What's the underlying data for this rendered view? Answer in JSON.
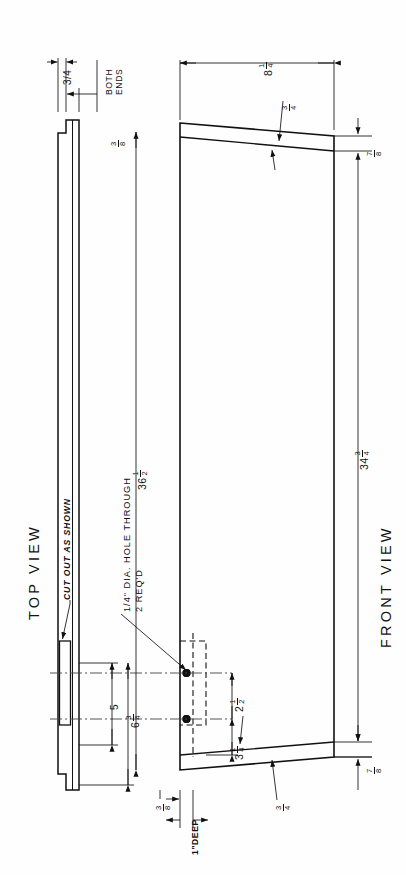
{
  "drawing": {
    "title": "Tapered board — two-view machine drawing",
    "views": [
      {
        "id": "top-view",
        "label": "TOP VIEW"
      },
      {
        "id": "front-view",
        "label": "FRONT VIEW"
      }
    ],
    "notes": [
      {
        "id": "both-ends",
        "line1": "BOTH",
        "line2": "ENDS"
      },
      {
        "id": "cut-out",
        "text": "CUT OUT AS SHOWN"
      },
      {
        "id": "hole-callout-line1",
        "text": "1/4\" DIA. HOLE THROUGH"
      },
      {
        "id": "hole-callout-line2",
        "text": "2 REQ'D"
      },
      {
        "id": "depth-note",
        "text": "1\"DEEP"
      }
    ],
    "dimensions": [
      {
        "id": "notch-width",
        "whole": "",
        "num": "3",
        "den": "4",
        "plain": "3/4",
        "view": "top",
        "desc": "notch width at both ends"
      },
      {
        "id": "notch-depth",
        "whole": "",
        "num": "3",
        "den": "8",
        "plain": "",
        "view": "top",
        "desc": "notch depth"
      },
      {
        "id": "top-left-offset",
        "whole": "8",
        "num": "1",
        "den": "4",
        "plain": "",
        "view": "front",
        "desc": "distance from left end to start of taper"
      },
      {
        "id": "thickness-top",
        "whole": "",
        "num": "3",
        "den": "4",
        "plain": "",
        "view": "front",
        "desc": "board edge thickness at top taper"
      },
      {
        "id": "right-end-height",
        "whole": "",
        "num": "7",
        "den": "8",
        "plain": "",
        "view": "front",
        "desc": "right end thickness, top"
      },
      {
        "id": "overall-length",
        "whole": "36",
        "num": "1",
        "den": "2",
        "plain": "",
        "view": "front",
        "desc": "overall length"
      },
      {
        "id": "board-width",
        "whole": "34",
        "num": "3",
        "den": "4",
        "plain": "",
        "view": "front",
        "desc": "overall width, right side"
      },
      {
        "id": "hole-edge-dist",
        "whole": "5",
        "num": "",
        "den": "",
        "plain": "5",
        "view": "top",
        "desc": "5 in. dimension"
      },
      {
        "id": "hole-spacing-long",
        "whole": "6",
        "num": "3",
        "den": "4",
        "plain": "",
        "view": "top",
        "desc": "6 3/4 in. dimension"
      },
      {
        "id": "hole-spacing",
        "whole": "2",
        "num": "1",
        "den": "2",
        "plain": "",
        "view": "front",
        "desc": "spacing between the two holes"
      },
      {
        "id": "hole-to-edge",
        "whole": "3",
        "num": "1",
        "den": "4",
        "plain": "",
        "view": "front",
        "desc": "lower hole to bottom edge"
      },
      {
        "id": "cutout-width",
        "whole": "",
        "num": "3",
        "den": "8",
        "plain": "",
        "view": "front",
        "desc": "cut-out width"
      },
      {
        "id": "thickness-bottom",
        "whole": "",
        "num": "3",
        "den": "4",
        "plain": "",
        "view": "front",
        "desc": "board edge thickness at bottom taper"
      },
      {
        "id": "right-end-bottom",
        "whole": "",
        "num": "7",
        "den": "8",
        "plain": "",
        "view": "front",
        "desc": "right end thickness, bottom"
      }
    ],
    "style": {
      "ink": "#111111",
      "paper": "#fefefe",
      "thin": "#3a3a3a"
    }
  }
}
